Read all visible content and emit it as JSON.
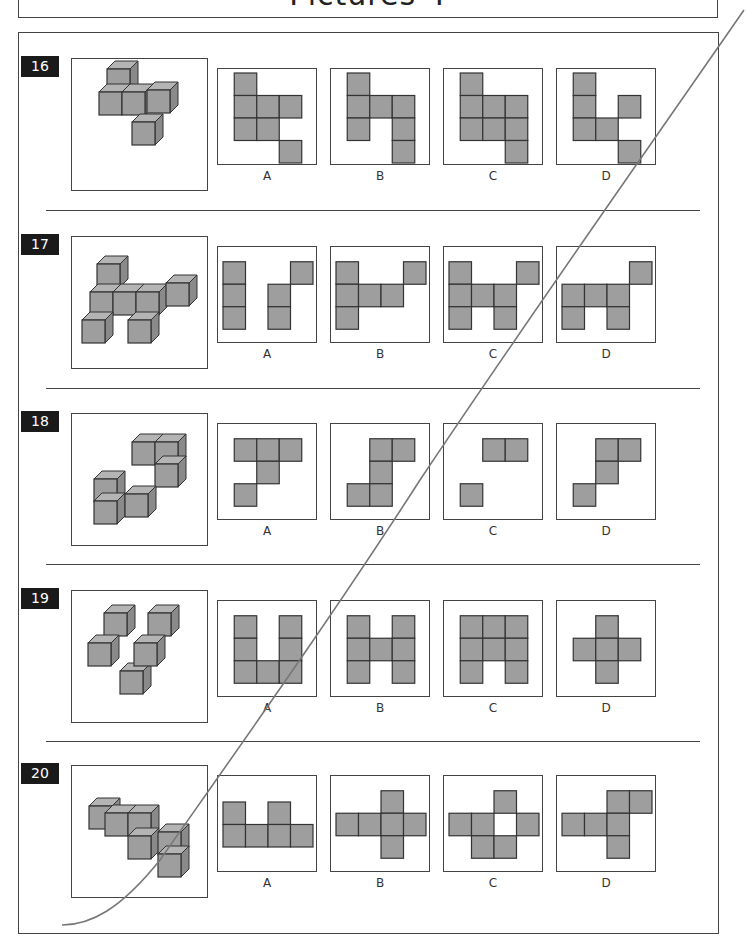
{
  "page": {
    "title": "Pictures 4",
    "colors": {
      "cube_fill": "#9e9e9e",
      "cube_top": "#b4b4b4",
      "cube_side": "#8a8a8a",
      "outline": "#333333",
      "number_bg": "#1a1a1a"
    }
  },
  "questions": [
    {
      "number": "16",
      "cubes_description": "3D cube arrangement of 6 cubes",
      "options": [
        {
          "label": "A",
          "cells": [
            [
              0,
              0
            ],
            [
              0,
              1
            ],
            [
              1,
              1
            ],
            [
              2,
              1
            ],
            [
              0,
              2
            ],
            [
              1,
              2
            ],
            [
              2,
              3
            ]
          ]
        },
        {
          "label": "B",
          "cells": [
            [
              0,
              0
            ],
            [
              0,
              1
            ],
            [
              1,
              1
            ],
            [
              2,
              1
            ],
            [
              0,
              2
            ],
            [
              2,
              2
            ],
            [
              2,
              3
            ]
          ]
        },
        {
          "label": "C",
          "cells": [
            [
              0,
              0
            ],
            [
              0,
              1
            ],
            [
              1,
              1
            ],
            [
              2,
              1
            ],
            [
              0,
              2
            ],
            [
              1,
              2
            ],
            [
              2,
              2
            ],
            [
              2,
              3
            ]
          ]
        },
        {
          "label": "D",
          "cells": [
            [
              0,
              0
            ],
            [
              0,
              1
            ],
            [
              2,
              1
            ],
            [
              0,
              2
            ],
            [
              1,
              2
            ],
            [
              2,
              3
            ]
          ]
        }
      ]
    },
    {
      "number": "17",
      "cubes_description": "3D cube arrangement of 7 cubes",
      "options": [
        {
          "label": "A",
          "cells": [
            [
              0,
              0
            ],
            [
              0,
              1
            ],
            [
              0,
              2
            ],
            [
              3,
              0
            ],
            [
              2,
              1
            ],
            [
              2,
              2
            ]
          ]
        },
        {
          "label": "B",
          "cells": [
            [
              0,
              0
            ],
            [
              0,
              1
            ],
            [
              1,
              1
            ],
            [
              2,
              1
            ],
            [
              0,
              2
            ],
            [
              3,
              0
            ]
          ]
        },
        {
          "label": "C",
          "cells": [
            [
              0,
              0
            ],
            [
              0,
              1
            ],
            [
              1,
              1
            ],
            [
              2,
              1
            ],
            [
              0,
              2
            ],
            [
              2,
              2
            ],
            [
              3,
              0
            ]
          ]
        },
        {
          "label": "D",
          "cells": [
            [
              3,
              0
            ],
            [
              0,
              1
            ],
            [
              1,
              1
            ],
            [
              2,
              1
            ],
            [
              0,
              2
            ],
            [
              2,
              2
            ]
          ]
        }
      ]
    },
    {
      "number": "18",
      "cubes_description": "3D cube arrangement of 6 cubes",
      "options": [
        {
          "label": "A",
          "cells": [
            [
              0,
              0
            ],
            [
              1,
              0
            ],
            [
              2,
              0
            ],
            [
              1,
              1
            ],
            [
              0,
              2
            ]
          ]
        },
        {
          "label": "B",
          "cells": [
            [
              1,
              0
            ],
            [
              2,
              0
            ],
            [
              1,
              1
            ],
            [
              0,
              2
            ],
            [
              1,
              2
            ]
          ]
        },
        {
          "label": "C",
          "cells": [
            [
              1,
              0
            ],
            [
              2,
              0
            ],
            [
              0,
              2
            ]
          ]
        },
        {
          "label": "D",
          "cells": [
            [
              1,
              0
            ],
            [
              2,
              0
            ],
            [
              1,
              1
            ],
            [
              0,
              2
            ]
          ]
        }
      ]
    },
    {
      "number": "19",
      "cubes_description": "3D cube arrangement of 7 cubes",
      "options": [
        {
          "label": "A",
          "cells": [
            [
              0,
              0
            ],
            [
              2,
              0
            ],
            [
              0,
              1
            ],
            [
              2,
              1
            ],
            [
              0,
              2
            ],
            [
              1,
              2
            ],
            [
              2,
              2
            ]
          ]
        },
        {
          "label": "B",
          "cells": [
            [
              0,
              0
            ],
            [
              2,
              0
            ],
            [
              0,
              1
            ],
            [
              1,
              1
            ],
            [
              2,
              1
            ],
            [
              0,
              2
            ],
            [
              2,
              2
            ]
          ]
        },
        {
          "label": "C",
          "cells": [
            [
              0,
              0
            ],
            [
              1,
              0
            ],
            [
              2,
              0
            ],
            [
              0,
              1
            ],
            [
              1,
              1
            ],
            [
              2,
              1
            ],
            [
              0,
              2
            ],
            [
              2,
              2
            ]
          ]
        },
        {
          "label": "D",
          "cells": [
            [
              1,
              0
            ],
            [
              0,
              1
            ],
            [
              1,
              1
            ],
            [
              2,
              1
            ],
            [
              1,
              2
            ]
          ]
        }
      ]
    },
    {
      "number": "20",
      "cubes_description": "3D cube arrangement of 8 cubes",
      "options": [
        {
          "label": "A",
          "cells": [
            [
              0,
              0
            ],
            [
              2,
              0
            ],
            [
              0,
              1
            ],
            [
              1,
              1
            ],
            [
              2,
              1
            ],
            [
              3,
              1
            ]
          ]
        },
        {
          "label": "B",
          "cells": [
            [
              2,
              0
            ],
            [
              0,
              1
            ],
            [
              1,
              1
            ],
            [
              2,
              1
            ],
            [
              3,
              1
            ],
            [
              2,
              2
            ]
          ]
        },
        {
          "label": "C",
          "cells": [
            [
              2,
              0
            ],
            [
              0,
              1
            ],
            [
              1,
              1
            ],
            [
              3,
              1
            ],
            [
              1,
              2
            ],
            [
              2,
              2
            ]
          ]
        },
        {
          "label": "D",
          "cells": [
            [
              2,
              0
            ],
            [
              3,
              0
            ],
            [
              0,
              1
            ],
            [
              1,
              1
            ],
            [
              2,
              1
            ],
            [
              2,
              2
            ]
          ]
        }
      ]
    }
  ]
}
